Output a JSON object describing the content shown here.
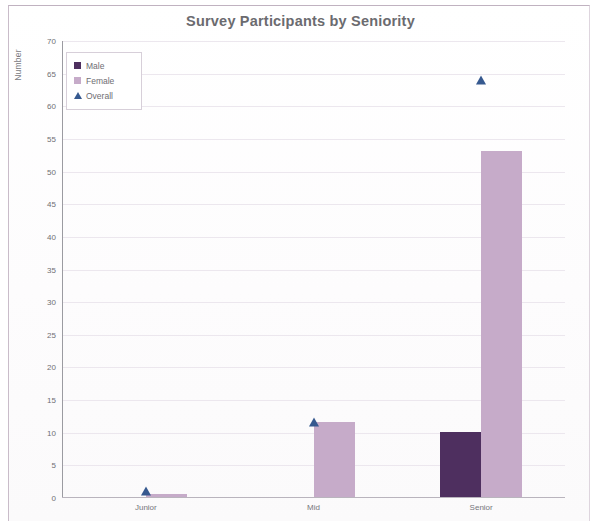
{
  "chart_data": {
    "type": "bar",
    "title": "Survey Participants by Seniority",
    "xlabel": "",
    "ylabel": "Number",
    "categories": [
      "Junior",
      "Mid",
      "Senior"
    ],
    "series": [
      {
        "name": "Male",
        "type": "bar",
        "color": "#4e2f5f",
        "values": [
          0,
          0,
          10
        ]
      },
      {
        "name": "Female",
        "type": "bar",
        "color": "#c6abc9",
        "values": [
          0.5,
          11.5,
          53
        ]
      },
      {
        "name": "Overall",
        "type": "scatter",
        "color": "#36598f",
        "values": [
          1,
          11.7,
          64
        ]
      }
    ],
    "ylim": [
      0,
      70
    ],
    "ytick_step": 5,
    "yticks": [
      0,
      5,
      10,
      15,
      20,
      25,
      30,
      35,
      40,
      45,
      50,
      55,
      60,
      65,
      70
    ],
    "grid": true,
    "grid_axis": "y",
    "legend_position": "top-left",
    "legend_entries": [
      "Male",
      "Female",
      "Overall"
    ]
  },
  "chart": {
    "title": "Survey Participants by Seniority",
    "y_axis_title": "Number"
  },
  "legend": {
    "items": [
      {
        "label": "Male",
        "marker": "square-swatch-icon"
      },
      {
        "label": "Female",
        "marker": "square-swatch-icon"
      },
      {
        "label": "Overall",
        "marker": "triangle-marker-icon"
      }
    ]
  }
}
